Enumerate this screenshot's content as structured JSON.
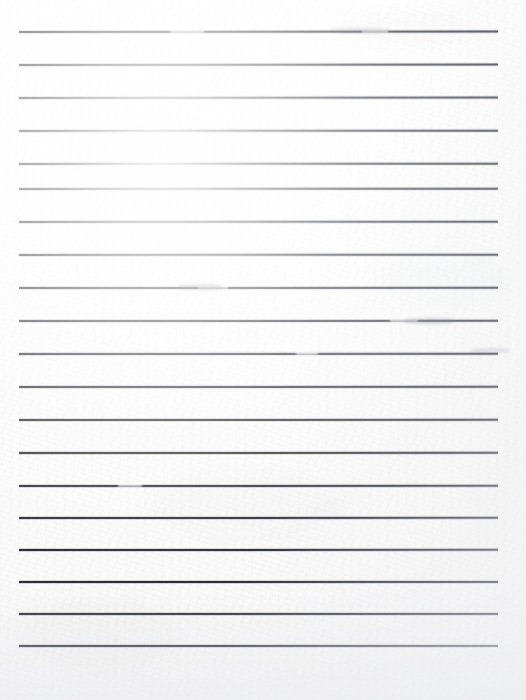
{
  "document": {
    "kind": "scanned-lined-paper",
    "title": "Blank ruled notebook page",
    "width": 526,
    "height": 700,
    "paper_color": "#fdfdfd",
    "rule_color": "#2b2d31",
    "rule_count": 19,
    "rule_spacing_px": 33,
    "rule_thickness_px": 2,
    "left_margin_px": 19,
    "right_margin_px": 28,
    "top_margin_px": 31,
    "bottom_margin_px": 55,
    "has_written_content": false,
    "text_content": ""
  },
  "rules": [
    {
      "index": 1,
      "y": 31,
      "x1": 19,
      "x2": 498,
      "slant": -0.9
    },
    {
      "index": 2,
      "y": 64,
      "x1": 19,
      "x2": 498,
      "slant": -0.8
    },
    {
      "index": 3,
      "y": 97,
      "x1": 19,
      "x2": 498,
      "slant": -0.8
    },
    {
      "index": 4,
      "y": 130,
      "x1": 19,
      "x2": 498,
      "slant": -0.7
    },
    {
      "index": 5,
      "y": 163,
      "x1": 19,
      "x2": 498,
      "slant": -0.7
    },
    {
      "index": 6,
      "y": 188,
      "x1": 19,
      "x2": 498,
      "slant": -0.6
    },
    {
      "index": 7,
      "y": 221,
      "x1": 19,
      "x2": 498,
      "slant": -0.6
    },
    {
      "index": 8,
      "y": 254,
      "x1": 19,
      "x2": 498,
      "slant": -0.6
    },
    {
      "index": 9,
      "y": 287,
      "x1": 19,
      "x2": 498,
      "slant": -0.5
    },
    {
      "index": 10,
      "y": 320,
      "x1": 19,
      "x2": 498,
      "slant": -0.5
    },
    {
      "index": 11,
      "y": 353,
      "x1": 19,
      "x2": 498,
      "slant": -0.5
    },
    {
      "index": 12,
      "y": 386,
      "x1": 19,
      "x2": 498,
      "slant": -0.4
    },
    {
      "index": 13,
      "y": 419,
      "x1": 19,
      "x2": 498,
      "slant": -0.4
    },
    {
      "index": 14,
      "y": 452,
      "x1": 19,
      "x2": 498,
      "slant": -0.4
    },
    {
      "index": 15,
      "y": 485,
      "x1": 19,
      "x2": 498,
      "slant": -0.3
    },
    {
      "index": 16,
      "y": 517,
      "x1": 19,
      "x2": 498,
      "slant": -0.3
    },
    {
      "index": 17,
      "y": 549,
      "x1": 19,
      "x2": 498,
      "slant": -0.3
    },
    {
      "index": 18,
      "y": 581,
      "x1": 19,
      "x2": 498,
      "slant": -0.2
    },
    {
      "index": 19,
      "y": 613,
      "x1": 19,
      "x2": 498,
      "slant": -0.2
    },
    {
      "index": 20,
      "y": 645,
      "x1": 19,
      "x2": 498,
      "slant": -0.2
    }
  ],
  "artifacts": {
    "blotches": [
      {
        "x": 330,
        "y": 10,
        "w": 150,
        "h": 34,
        "opacity": 0.05
      },
      {
        "x": 60,
        "y": 120,
        "w": 180,
        "h": 60,
        "opacity": 0.04
      },
      {
        "x": 380,
        "y": 250,
        "w": 130,
        "h": 55,
        "opacity": 0.045
      },
      {
        "x": 150,
        "y": 470,
        "w": 200,
        "h": 70,
        "opacity": 0.035
      },
      {
        "x": 20,
        "y": 600,
        "w": 160,
        "h": 70,
        "opacity": 0.04
      }
    ],
    "rule_breaks": [
      {
        "x": 170,
        "y": 31,
        "w": 34,
        "h": 3
      },
      {
        "x": 362,
        "y": 31,
        "w": 26,
        "h": 3
      },
      {
        "x": 198,
        "y": 287,
        "w": 30,
        "h": 3
      },
      {
        "x": 390,
        "y": 320,
        "w": 28,
        "h": 3
      },
      {
        "x": 296,
        "y": 353,
        "w": 22,
        "h": 3
      },
      {
        "x": 118,
        "y": 485,
        "w": 24,
        "h": 3
      }
    ],
    "smudges": [
      {
        "x": 178,
        "y": 284,
        "w": 44,
        "h": 6,
        "opacity": 0.3
      },
      {
        "x": 404,
        "y": 318,
        "w": 50,
        "h": 6,
        "opacity": 0.28
      },
      {
        "x": 330,
        "y": 28,
        "w": 60,
        "h": 5,
        "opacity": 0.22
      },
      {
        "x": 470,
        "y": 348,
        "w": 40,
        "h": 5,
        "opacity": 0.2
      }
    ]
  }
}
